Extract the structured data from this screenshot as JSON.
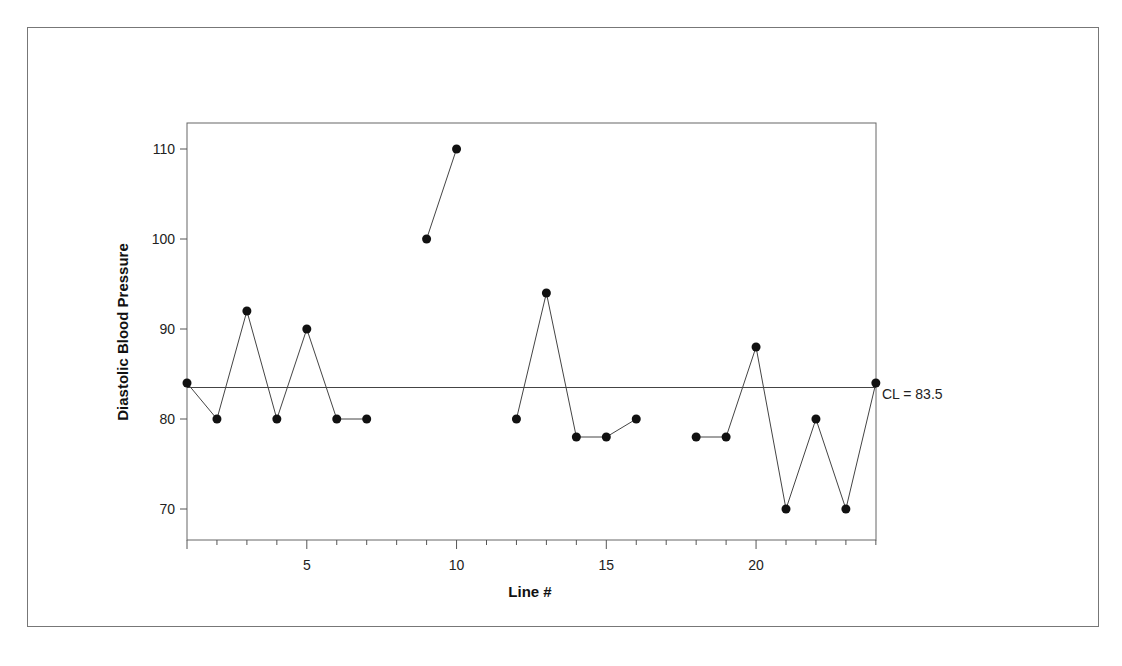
{
  "chart_data": {
    "type": "line",
    "title": "",
    "xlabel": "Line #",
    "ylabel": "Diastolic Blood Pressure",
    "xlim": [
      1,
      24
    ],
    "ylim": [
      67,
      113
    ],
    "x_ticks": [
      5,
      10,
      15,
      20
    ],
    "y_ticks": [
      70,
      80,
      90,
      100,
      110
    ],
    "grid": false,
    "legend": null,
    "center_line": {
      "value": 83.5,
      "label": "CL = 83.5"
    },
    "series": [
      {
        "name": "Diastolic Blood Pressure",
        "x": [
          1,
          2,
          3,
          4,
          5,
          6,
          7,
          8,
          9,
          10,
          11,
          12,
          13,
          14,
          15,
          16,
          17,
          18,
          19,
          20,
          21,
          22,
          23,
          24
        ],
        "values": [
          84,
          80,
          92,
          80,
          90,
          80,
          80,
          null,
          100,
          110,
          null,
          80,
          94,
          78,
          78,
          80,
          null,
          78,
          78,
          88,
          70,
          80,
          70,
          84
        ]
      }
    ]
  }
}
